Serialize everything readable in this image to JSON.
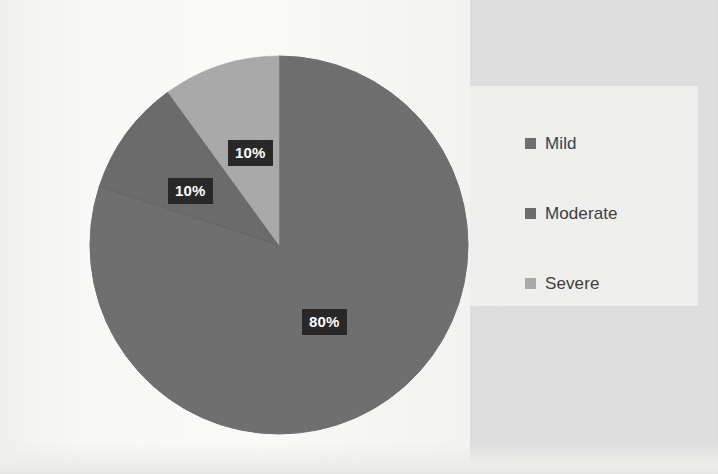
{
  "chart_data": {
    "type": "pie",
    "title": "",
    "categories": [
      "Mild",
      "Moderate",
      "Severe"
    ],
    "values": [
      80,
      10,
      10
    ],
    "value_labels": [
      "80%",
      "10%",
      "10%"
    ],
    "unit": "percent",
    "total": 100,
    "start_angle_deg": 0,
    "direction": "clockwise",
    "legend_position": "right",
    "grid": false,
    "slice_colors": [
      "#6e6e6e",
      "#6a6a6a",
      "#a9a9a9"
    ],
    "slices": [
      {
        "name": "Mild",
        "value": 80,
        "label": "80%",
        "color": "#6e6e6e",
        "start_deg": 0,
        "end_deg": 288
      },
      {
        "name": "Moderate",
        "value": 10,
        "label": "10%",
        "color": "#6a6a6a",
        "start_deg": 288,
        "end_deg": 324
      },
      {
        "name": "Severe",
        "value": 10,
        "label": "10%",
        "color": "#a9a9a9",
        "start_deg": 324,
        "end_deg": 360
      }
    ]
  },
  "labels": {
    "mild_pct": "80%",
    "moderate_pct": "10%",
    "severe_pct": "10%"
  },
  "legend": {
    "items": [
      {
        "label": "Mild",
        "color": "#6e6e6e"
      },
      {
        "label": "Moderate",
        "color": "#6a6a6a"
      },
      {
        "label": "Severe",
        "color": "#a9a9a9"
      }
    ]
  },
  "colors": {
    "background": "#f7f7f6",
    "right_panel": "#dedede",
    "legend_panel": "#f0f0ee",
    "label_box": "#262626",
    "label_text": "#ffffff",
    "legend_text": "#3c3c3c"
  }
}
